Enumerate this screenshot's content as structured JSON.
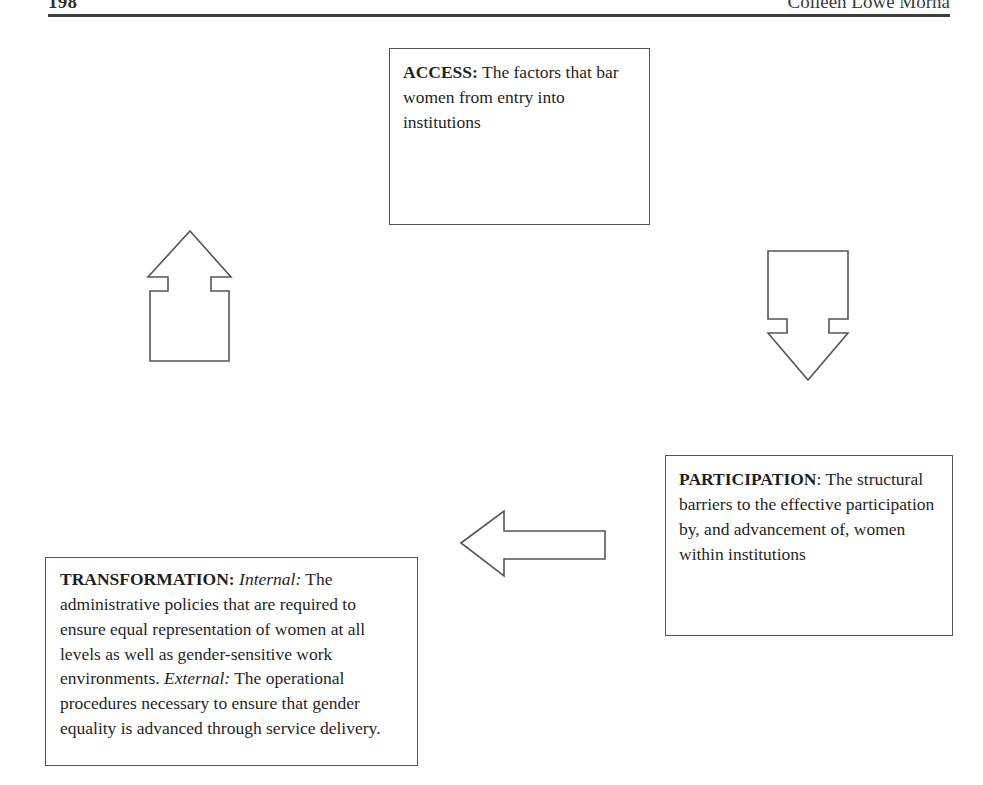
{
  "page": {
    "running_head_left": "198",
    "running_head_right": "Colleen Lowe Morna"
  },
  "diagram": {
    "boxes": [
      {
        "id": "access",
        "lead": "ACCESS:",
        "body": " The factors that bar women from entry into institutions"
      },
      {
        "id": "participation",
        "lead": "PARTICIPATION",
        "lead_suffix": ": ",
        "body": "The structural barriers to the effective participation by, and advancement of, women within institutions"
      },
      {
        "id": "transformation",
        "lead": "TRANSFORMATION:",
        "internal_label": " Internal:",
        "internal_body": " The administrative policies that are required to ensure equal representation of women at all levels as well as gender-sensitive work environments.",
        "external_label": " External:",
        "external_body": " The operational procedures necessary to ensure that gender equality is advanced through service delivery."
      }
    ],
    "arrows": [
      {
        "id": "arrow-up",
        "direction": "up",
        "label": "transformation-to-access"
      },
      {
        "id": "arrow-down",
        "direction": "down",
        "label": "access-to-participation"
      },
      {
        "id": "arrow-left",
        "direction": "left",
        "label": "participation-to-transformation"
      }
    ],
    "colors": {
      "stroke": "#555555",
      "fill": "#ffffff",
      "text": "#1f1f1f",
      "rule": "#3c3c3c"
    }
  }
}
